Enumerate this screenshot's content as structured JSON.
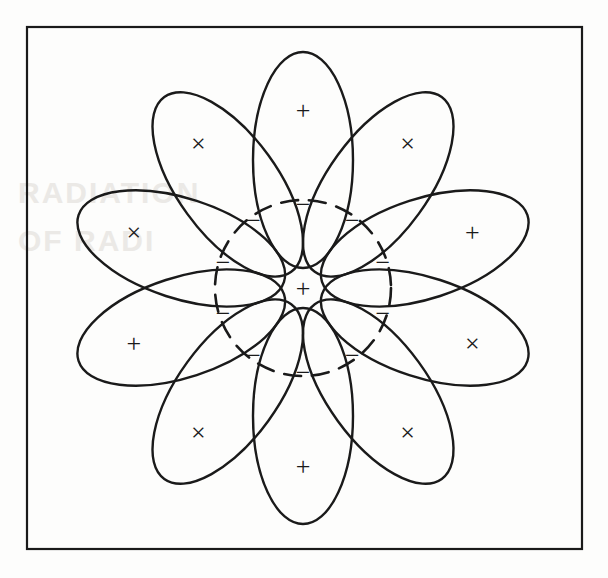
{
  "figure": {
    "background_color": "#fdfdfc",
    "ink_color": "#1a1a1a",
    "frame": {
      "label": "figure-border",
      "x": 27,
      "y": 27,
      "width": 555,
      "height": 522,
      "stroke_width": 2.2
    },
    "center": {
      "x": 303,
      "y": 288,
      "marker": "+",
      "marker_font_size": 26
    },
    "inner_circle": {
      "label": "dashed-inner-circle",
      "cx": 303,
      "cy": 288,
      "r": 88,
      "style": "dashed",
      "dash_pattern": "17 11",
      "stroke_width": 2.6
    },
    "petals": {
      "count": 10,
      "ellipse_semi_major": 108,
      "ellipse_semi_minor": 50,
      "center_radius": 128,
      "outer_marker_radius": 178,
      "inner_marker_radius": 84,
      "stroke_width": 2.4,
      "outer_marker_font_size": 26,
      "inner_marker_font_size": 26,
      "items": [
        {
          "index": 0,
          "angle_deg": 0,
          "position": "top",
          "outer_marker": "+",
          "inner_marker": "−"
        },
        {
          "index": 1,
          "angle_deg": 36,
          "position": "upper-right",
          "outer_marker": "×",
          "inner_marker": "−"
        },
        {
          "index": 2,
          "angle_deg": 72,
          "position": "right-upper",
          "outer_marker": "+",
          "inner_marker": "−"
        },
        {
          "index": 3,
          "angle_deg": 108,
          "position": "right-lower",
          "outer_marker": "×",
          "inner_marker": "−"
        },
        {
          "index": 4,
          "angle_deg": 144,
          "position": "lower-right",
          "outer_marker": "×",
          "inner_marker": "−"
        },
        {
          "index": 5,
          "angle_deg": 180,
          "position": "bottom",
          "outer_marker": "+",
          "inner_marker": "−"
        },
        {
          "index": 6,
          "angle_deg": 216,
          "position": "lower-left",
          "outer_marker": "×",
          "inner_marker": "−"
        },
        {
          "index": 7,
          "angle_deg": 252,
          "position": "left-lower",
          "outer_marker": "+",
          "inner_marker": "−"
        },
        {
          "index": 8,
          "angle_deg": 288,
          "position": "left-upper",
          "outer_marker": "×",
          "inner_marker": "−"
        },
        {
          "index": 9,
          "angle_deg": 324,
          "position": "upper-left",
          "outer_marker": "×",
          "inner_marker": "−"
        }
      ]
    },
    "background_bleed": {
      "visible": true,
      "color": "#ebe9e6",
      "lines": [
        {
          "text": "RADIATION",
          "x": 18,
          "y": 176,
          "size": 30
        },
        {
          "text": "OF RADI",
          "x": 18,
          "y": 224,
          "size": 30
        }
      ]
    }
  }
}
